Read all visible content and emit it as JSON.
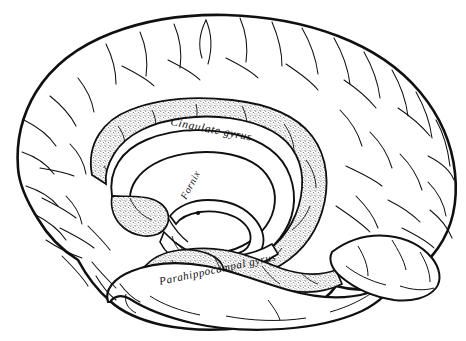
{
  "figure": {
    "name": "medial-surface-of-the-brain",
    "background_color": "#ffffff",
    "ink_color": "#101010",
    "stipple_color": "#4a4a4a",
    "width": 466,
    "height": 341
  },
  "labels": [
    {
      "id": "cingulate-gyrus",
      "text": "Cingulate gyrus",
      "x": 170,
      "y": 125,
      "rotation": 11,
      "font_size": 11.5
    },
    {
      "id": "fornix",
      "text": "Fornix",
      "x": 186,
      "y": 200,
      "rotation": -62,
      "font_size": 10
    },
    {
      "id": "parahippocampal-gyrus",
      "text": "Parahippocampal  gyrus",
      "x": 160,
      "y": 285,
      "rotation": -12,
      "font_size": 11
    }
  ],
  "regions": [
    {
      "id": "cingulate-gyrus-region",
      "label": "Cingulate gyrus",
      "shading": "stippled"
    },
    {
      "id": "parahippocampal-gyrus-region",
      "label": "Parahippocampal gyrus",
      "shading": "stippled"
    },
    {
      "id": "corpus-callosum-region",
      "label": "Corpus callosum",
      "shading": "plain"
    },
    {
      "id": "fornix-region",
      "label": "Fornix",
      "shading": "plain"
    },
    {
      "id": "frontal-lobe-region",
      "label": "Frontal lobe",
      "shading": "plain"
    },
    {
      "id": "parietal-lobe-region",
      "label": "Parietal lobe",
      "shading": "plain"
    },
    {
      "id": "occipital-lobe-region",
      "label": "Occipital lobe",
      "shading": "plain"
    },
    {
      "id": "temporal-lobe-region",
      "label": "Temporal lobe",
      "shading": "plain"
    },
    {
      "id": "cerebellum-brainstem-region",
      "label": "Brainstem",
      "shading": "plain"
    }
  ]
}
